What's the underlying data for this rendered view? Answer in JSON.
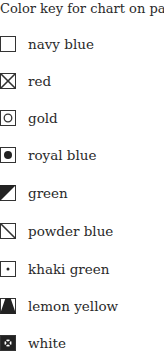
{
  "title": "Color key for chart on page",
  "items": [
    {
      "label": "navy blue",
      "icon": "empty-square-icon"
    },
    {
      "label": "red",
      "icon": "x-square-icon"
    },
    {
      "label": "gold",
      "icon": "circle-square-icon"
    },
    {
      "label": "royal blue",
      "icon": "filled-dot-square-icon"
    },
    {
      "label": "green",
      "icon": "half-filled-diagonal-square-icon"
    },
    {
      "label": "powder blue",
      "icon": "diagonal-line-square-icon"
    },
    {
      "label": "khaki green",
      "icon": "small-dot-square-icon"
    },
    {
      "label": "lemon yellow",
      "icon": "triangle-square-icon"
    },
    {
      "label": "white",
      "icon": "inverse-pattern-square-icon"
    }
  ]
}
